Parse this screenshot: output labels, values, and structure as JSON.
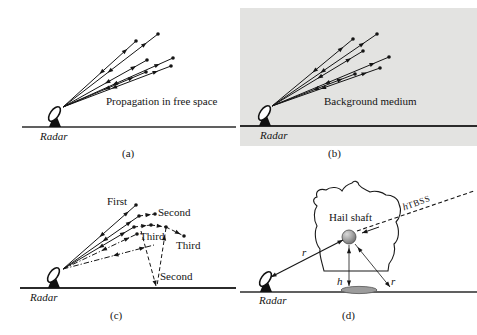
{
  "figure": {
    "background": "#ffffff",
    "panel_b_box_color": "#e3e3e1",
    "line_color": "#151515"
  },
  "panels": {
    "a": {
      "caption": "(a)",
      "radar_label": "Radar",
      "annotation": "Propagation in free space"
    },
    "b": {
      "caption": "(b)",
      "radar_label": "Radar",
      "annotation": "Background medium"
    },
    "c": {
      "caption": "(c)",
      "radar_label": "Radar",
      "labels": {
        "first": "First",
        "second_top": "Second",
        "third_left": "Third",
        "third_right": "Third",
        "second_bottom": "Second"
      }
    },
    "d": {
      "caption": "(d)",
      "radar_label": "Radar",
      "labels": {
        "hail_shaft": "Hail shaft",
        "range_r": "r",
        "height_h": "h",
        "ground_r": "r",
        "tbss_h": "h",
        "tbss": "TBSS"
      }
    }
  },
  "diagram": {
    "rays-a": [
      {
        "p": [
          63,
          107,
          136,
          41
        ],
        "style": "solid",
        "dot": true,
        "arrows": [
          {
            "t": 0.88,
            "dir": 1
          },
          {
            "t": 0.5,
            "dir": -1
          }
        ]
      },
      {
        "p": [
          63,
          107,
          158,
          34
        ],
        "style": "solid",
        "dot": true,
        "arrows": [
          {
            "t": 0.88,
            "dir": 1
          },
          {
            "t": 0.47,
            "dir": -1
          }
        ]
      },
      {
        "p": [
          63,
          107,
          147,
          60
        ],
        "style": "solid",
        "dot": true,
        "arrows": [
          {
            "t": 0.87,
            "dir": 1
          },
          {
            "t": 0.5,
            "dir": -1
          }
        ]
      },
      {
        "p": [
          63,
          107,
          173,
          58
        ],
        "style": "solid",
        "dot": true,
        "arrows": [
          {
            "t": 0.88,
            "dir": 1
          },
          {
            "t": 0.45,
            "dir": -1
          }
        ]
      },
      {
        "p": [
          63,
          107,
          146,
          72
        ],
        "style": "solid",
        "dot": true,
        "arrows": [
          {
            "t": 0.85,
            "dir": 1
          },
          {
            "t": 0.5,
            "dir": -1
          }
        ]
      },
      {
        "p": [
          63,
          107,
          171,
          66
        ],
        "style": "solid",
        "dot": true,
        "arrows": [
          {
            "t": 0.88,
            "dir": 1
          },
          {
            "t": 0.45,
            "dir": -1
          }
        ]
      }
    ],
    "rays-b": [
      {
        "p": [
          272,
          106,
          353,
          39
        ],
        "style": "solid",
        "dot": true,
        "arrows": [
          {
            "t": 0.88,
            "dir": 1
          },
          {
            "t": 0.5,
            "dir": -1
          }
        ]
      },
      {
        "p": [
          272,
          106,
          377,
          34
        ],
        "style": "solid",
        "dot": true,
        "arrows": [
          {
            "t": 0.88,
            "dir": 1
          },
          {
            "t": 0.46,
            "dir": -1
          }
        ]
      },
      {
        "p": [
          272,
          106,
          363,
          51
        ],
        "style": "solid",
        "dot": true,
        "arrows": [
          {
            "t": 0.87,
            "dir": 1
          },
          {
            "t": 0.5,
            "dir": -1
          }
        ]
      },
      {
        "p": [
          272,
          106,
          389,
          57
        ],
        "style": "solid",
        "dot": true,
        "arrows": [
          {
            "t": 0.88,
            "dir": 1
          },
          {
            "t": 0.45,
            "dir": -1
          }
        ]
      },
      {
        "p": [
          272,
          106,
          355,
          74
        ],
        "style": "solid",
        "dot": true,
        "arrows": [
          {
            "t": 0.85,
            "dir": 1
          },
          {
            "t": 0.5,
            "dir": -1
          }
        ]
      },
      {
        "p": [
          272,
          106,
          380,
          68
        ],
        "style": "solid",
        "dot": true,
        "arrows": [
          {
            "t": 0.88,
            "dir": 1
          },
          {
            "t": 0.45,
            "dir": -1
          }
        ]
      }
    ],
    "rays-c": [
      {
        "p": [
          63,
          269,
          136,
          205
        ],
        "style": "solid",
        "dot": true,
        "arrows": [
          {
            "t": 0.9,
            "dir": 1
          },
          {
            "t": 0.5,
            "dir": -1
          }
        ]
      },
      {
        "p": [
          63,
          269,
          139,
          216
        ],
        "style": "solid",
        "dot": true,
        "arrows": [
          {
            "t": 0.9,
            "dir": 1
          },
          {
            "t": 0.52,
            "dir": -1
          }
        ]
      },
      {
        "p": [
          63,
          269,
          134,
          227
        ],
        "style": "solid",
        "dot": true,
        "arrows": [
          {
            "t": 0.88,
            "dir": 1
          },
          {
            "t": 0.5,
            "dir": -1
          }
        ]
      },
      {
        "p": [
          139,
          216,
          155,
          214
        ],
        "style": "dashed",
        "dot": true,
        "arrows": [
          {
            "t": 0.75,
            "dir": 1
          }
        ]
      },
      {
        "p": [
          134,
          227,
          151,
          225
        ],
        "style": "dashed",
        "dot": true,
        "arrows": [
          {
            "t": 0.75,
            "dir": 1
          }
        ]
      },
      {
        "p": [
          151,
          225,
          166,
          227
        ],
        "style": "dashed",
        "dot": true,
        "arrows": [
          {
            "t": 0.75,
            "dir": 1
          }
        ]
      },
      {
        "p": [
          166,
          227,
          184,
          236
        ],
        "style": "dashed",
        "dot": true,
        "arrows": [
          {
            "t": 0.8,
            "dir": 1
          }
        ]
      },
      {
        "p": [
          63,
          269,
          137,
          234
        ],
        "style": "dashdot",
        "dot": true,
        "arrows": [
          {
            "t": 0.9,
            "dir": 1
          },
          {
            "t": 0.52,
            "dir": -1
          }
        ]
      },
      {
        "p": [
          63,
          269,
          154,
          245
        ],
        "style": "dashdot",
        "dot": false,
        "arrows": [
          {
            "t": 0.9,
            "dir": 1
          },
          {
            "t": 0.55,
            "dir": -1
          }
        ]
      },
      {
        "p": [
          141,
          231,
          156,
          286
        ],
        "style": "dashed",
        "dot": false,
        "arrows": [
          {
            "t": 1,
            "dir": 1
          }
        ]
      },
      {
        "p": [
          166,
          228,
          157,
          286
        ],
        "style": "dashed",
        "dot": false,
        "arrows": [
          {
            "t": 0.12,
            "dir": -1
          }
        ]
      }
    ],
    "rays-d": [
      {
        "p": [
          271,
          277,
          343,
          240
        ],
        "style": "solid",
        "w": 1.1,
        "dot": false,
        "arrows": [
          {
            "t": 0,
            "dir": -1
          },
          {
            "t": 1,
            "dir": 1
          }
        ]
      },
      {
        "p": [
          357,
          231,
          474,
          191
        ],
        "style": "dashed",
        "w": 1.1,
        "dot": false,
        "arrows": []
      },
      {
        "p": [
          379,
          227,
          362,
          233
        ],
        "style": "solid",
        "w": 1,
        "dot": false,
        "arrows": [
          {
            "t": 1,
            "dir": 1
          }
        ]
      },
      {
        "p": [
          349,
          245,
          349,
          286
        ],
        "style": "solid",
        "w": 0.8,
        "dot": false,
        "arrows": [
          {
            "t": 0.07,
            "dir": -1
          },
          {
            "t": 1,
            "dir": 1
          }
        ]
      },
      {
        "p": [
          355,
          244,
          390,
          287
        ],
        "style": "solid",
        "w": 0.8,
        "dot": false,
        "arrows": [
          {
            "t": 0.07,
            "dir": -1
          },
          {
            "t": 1,
            "dir": 1
          }
        ]
      }
    ]
  }
}
